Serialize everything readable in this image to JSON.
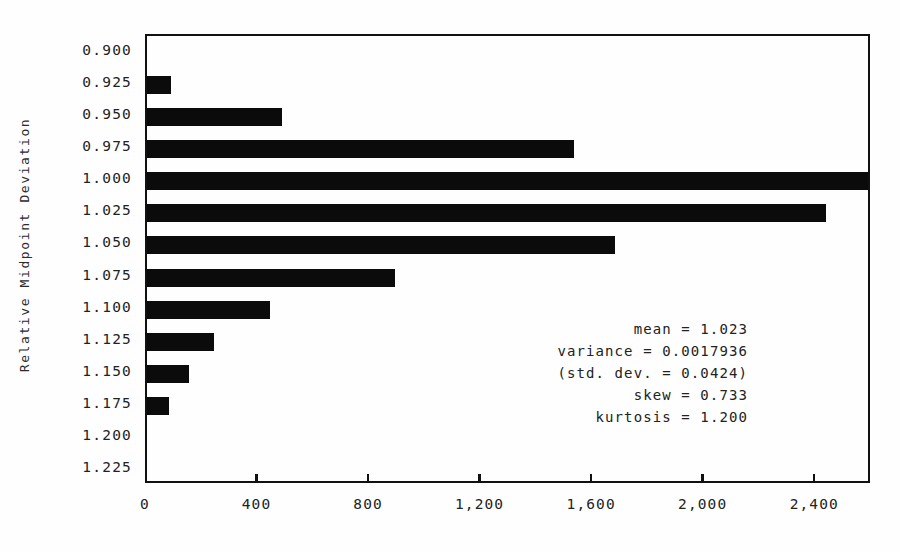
{
  "chart_data": {
    "type": "bar",
    "orientation": "horizontal",
    "title": "",
    "xlabel": "",
    "ylabel": "Relative Midpoint Deviation",
    "categories": [
      "0.900",
      "0.925",
      "0.950",
      "0.975",
      "1.000",
      "1.025",
      "1.050",
      "1.075",
      "1.100",
      "1.125",
      "1.150",
      "1.175",
      "1.200",
      "1.225"
    ],
    "values": [
      0,
      86,
      483,
      1533,
      2600,
      2436,
      1680,
      888,
      440,
      240,
      150,
      79,
      0,
      0
    ],
    "xlim": [
      0,
      2600
    ],
    "ylim_categories": 14,
    "xticks": [
      0,
      400,
      800,
      1200,
      1600,
      2000,
      2400
    ],
    "xticklabels": [
      "0",
      "400",
      "800",
      "1,200",
      "1,600",
      "2,000",
      "2,400"
    ],
    "grid": false,
    "legend": null,
    "bar_color": "#0b0b0b",
    "background_color": "#fefefe",
    "axis_color": "#111111",
    "annotations": [
      "mean = 1.023",
      "variance = 0.0017936",
      "(std. dev. = 0.0424)",
      "skew = 0.733",
      "kurtosis = 1.200"
    ]
  },
  "stats": {
    "mean_line": "mean = 1.023",
    "variance_line": "variance = 0.0017936",
    "stddev_line": "(std. dev. = 0.0424)",
    "skew_line": "skew = 0.733",
    "kurtosis_line": "kurtosis = 1.200"
  }
}
